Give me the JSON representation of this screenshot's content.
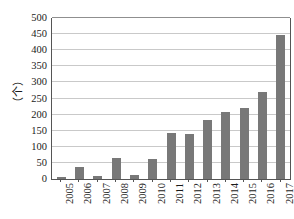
{
  "chart_data": {
    "type": "bar",
    "title": "",
    "xlabel": "",
    "ylabel": "（个）",
    "ylim": [
      0,
      500
    ],
    "ytick_step": 50,
    "grid": true,
    "legend": false,
    "bar_color": "#787878",
    "axis_color": "#555555",
    "grid_color": "#c9c9c9",
    "categories": [
      "2005",
      "2006",
      "2007",
      "2008",
      "2009",
      "2010",
      "2011",
      "2012",
      "2013",
      "2014",
      "2015",
      "2016",
      "2017"
    ],
    "values": [
      5,
      37,
      9,
      65,
      12,
      62,
      142,
      139,
      183,
      207,
      222,
      271,
      447
    ],
    "yticks": [
      "0",
      "50",
      "100",
      "150",
      "200",
      "250",
      "300",
      "350",
      "400",
      "450",
      "500"
    ]
  }
}
